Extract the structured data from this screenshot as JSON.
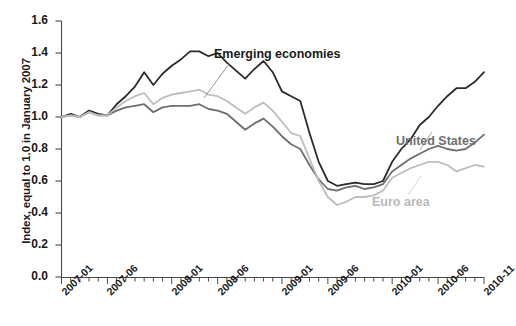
{
  "chart_data": {
    "type": "line",
    "title": "",
    "xlabel": "",
    "ylabel": "Index, equal to 1.0 in January 2007",
    "ylim": [
      0.0,
      1.6
    ],
    "yticks": [
      0.0,
      0.2,
      0.4,
      0.6,
      0.8,
      1.0,
      1.2,
      1.4,
      1.6
    ],
    "ytick_labels": [
      "0.0",
      "0.2",
      "0.4",
      "0.6",
      "0.8",
      "1.0",
      "1.2",
      "1.4",
      "1.6"
    ],
    "grid": false,
    "legend_position": "inline-annotations",
    "x": [
      "2007-01",
      "2007-02",
      "2007-03",
      "2007-04",
      "2007-05",
      "2007-06",
      "2007-07",
      "2007-08",
      "2007-09",
      "2007-10",
      "2007-11",
      "2007-12",
      "2008-01",
      "2008-02",
      "2008-03",
      "2008-04",
      "2008-05",
      "2008-06",
      "2008-07",
      "2008-08",
      "2008-09",
      "2008-10",
      "2008-11",
      "2008-12",
      "2009-01",
      "2009-02",
      "2009-03",
      "2009-04",
      "2009-05",
      "2009-06",
      "2009-07",
      "2009-08",
      "2009-09",
      "2009-10",
      "2009-11",
      "2009-12",
      "2010-01",
      "2010-02",
      "2010-03",
      "2010-04",
      "2010-05",
      "2010-06",
      "2010-07",
      "2010-08",
      "2010-09",
      "2010-10",
      "2010-11"
    ],
    "xtick_labels": [
      "2007-01",
      "2007-06",
      "2008-01",
      "2008-06",
      "2009-01",
      "2009-06",
      "2010-01",
      "2010-06",
      "2010-11"
    ],
    "xtick_indices": [
      0,
      5,
      12,
      17,
      24,
      29,
      36,
      41,
      46
    ],
    "series": [
      {
        "name": "Emerging economies",
        "color": "#2b2b2b",
        "values": [
          1.0,
          1.02,
          1.0,
          1.04,
          1.02,
          1.01,
          1.08,
          1.13,
          1.19,
          1.28,
          1.2,
          1.27,
          1.32,
          1.36,
          1.41,
          1.41,
          1.38,
          1.4,
          1.34,
          1.29,
          1.24,
          1.3,
          1.35,
          1.28,
          1.16,
          1.13,
          1.1,
          0.9,
          0.72,
          0.6,
          0.57,
          0.58,
          0.59,
          0.58,
          0.58,
          0.6,
          0.72,
          0.8,
          0.86,
          0.95,
          1.0,
          1.07,
          1.13,
          1.18,
          1.18,
          1.22,
          1.28
        ]
      },
      {
        "name": "United States",
        "color": "#6e6e6e",
        "values": [
          1.0,
          1.01,
          1.0,
          1.03,
          1.01,
          1.01,
          1.04,
          1.06,
          1.07,
          1.08,
          1.03,
          1.06,
          1.07,
          1.07,
          1.07,
          1.08,
          1.05,
          1.04,
          1.02,
          0.97,
          0.92,
          0.96,
          0.99,
          0.94,
          0.88,
          0.83,
          0.8,
          0.7,
          0.61,
          0.55,
          0.54,
          0.56,
          0.57,
          0.55,
          0.56,
          0.58,
          0.66,
          0.7,
          0.74,
          0.77,
          0.8,
          0.82,
          0.8,
          0.79,
          0.8,
          0.84,
          0.89
        ]
      },
      {
        "name": "Euro area",
        "color": "#bdbdbd",
        "values": [
          1.0,
          1.01,
          1.0,
          1.03,
          1.01,
          1.01,
          1.06,
          1.1,
          1.13,
          1.15,
          1.08,
          1.12,
          1.14,
          1.15,
          1.16,
          1.17,
          1.14,
          1.13,
          1.1,
          1.06,
          1.02,
          1.06,
          1.09,
          1.04,
          0.97,
          0.9,
          0.88,
          0.74,
          0.6,
          0.5,
          0.45,
          0.47,
          0.5,
          0.5,
          0.51,
          0.54,
          0.62,
          0.65,
          0.68,
          0.7,
          0.72,
          0.72,
          0.7,
          0.66,
          0.68,
          0.7,
          0.69
        ]
      }
    ],
    "annotations": [
      {
        "text": "Emerging economies",
        "series": "Emerging economies",
        "color": "#1a1a1a"
      },
      {
        "text": "United States",
        "series": "United States",
        "color": "#6e6e6e"
      },
      {
        "text": "Euro area",
        "series": "Euro area",
        "color": "#b9b9b9"
      }
    ]
  }
}
